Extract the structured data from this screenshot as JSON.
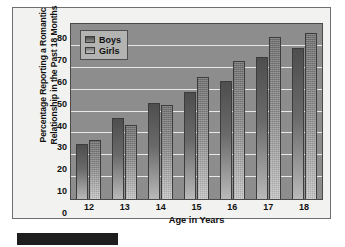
{
  "chart_data": {
    "type": "bar",
    "title": "",
    "subtitle": "",
    "xlabel": "Age in Years",
    "ylabel": "Percentage Reporting a Romantic Relationship in the Past 18 Months",
    "categories": [
      "12",
      "13",
      "14",
      "15",
      "16",
      "17",
      "18"
    ],
    "series": [
      {
        "name": "Boys",
        "values": [
          25,
          37,
          44,
          49,
          54,
          65,
          69
        ],
        "color": "#5a5a5a"
      },
      {
        "name": "Girls",
        "values": [
          27,
          34,
          43,
          56,
          63,
          74,
          76
        ],
        "color": "#9a9a9a"
      }
    ],
    "ylim": [
      0,
      80
    ],
    "yticks": [
      0,
      10,
      20,
      30,
      40,
      50,
      60,
      70,
      80
    ],
    "ytick_labels": [
      "0",
      "10",
      "20",
      "30",
      "40",
      "50",
      "60",
      "70",
      "80"
    ],
    "grid": true,
    "grid_axis": "y",
    "legend_position": "top-left",
    "plot_background": "#8d8d8d",
    "gridline_color": "#e8e8e6",
    "figure_background": "#f2f2f0"
  },
  "legend": {
    "entries": [
      {
        "label": "Boys"
      },
      {
        "label": "Girls"
      }
    ]
  },
  "axes": {
    "x_title": "Age in Years",
    "y_title": "Percentage Reporting a Romantic Relationship in the Past 18 Months"
  },
  "annotations": {
    "redaction_bar": ""
  }
}
